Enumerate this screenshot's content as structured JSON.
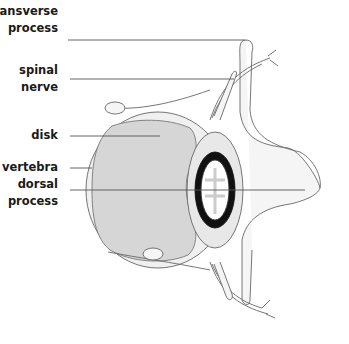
{
  "diagram": {
    "labels": [
      {
        "id": "transverse-process",
        "line1": "transverse",
        "line2": "process"
      },
      {
        "id": "spinal-nerve",
        "line1": "spinal",
        "line2": "nerve"
      },
      {
        "id": "disk",
        "line1": "disk"
      },
      {
        "id": "vertebra",
        "line1": "vertebra"
      },
      {
        "id": "dorsal-process",
        "line1": "dorsal",
        "line2": "process"
      }
    ],
    "colors": {
      "disk_fill": "#d6d6d6",
      "outline": "#555555",
      "cord_dark": "#111111",
      "leader_line": "#555555"
    }
  }
}
